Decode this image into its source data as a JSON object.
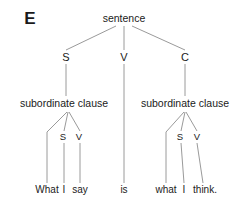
{
  "figure": {
    "label": "E",
    "caption_x": 30,
    "caption_y": 18
  },
  "colors": {
    "background": "#ffffff",
    "text": "#1a1a1a",
    "edge": "#9a9a9a"
  },
  "tree": {
    "root": {
      "text": "sentence",
      "x": 124,
      "y": 18
    },
    "level_categories": [
      {
        "text": "S",
        "x": 66,
        "y": 57
      },
      {
        "text": "V",
        "x": 124,
        "y": 57
      },
      {
        "text": "C",
        "x": 185,
        "y": 57
      }
    ],
    "clauses": [
      {
        "text": "subordinate clause",
        "x": 64,
        "y": 103
      },
      {
        "text": "subordinate clause",
        "x": 185,
        "y": 103
      }
    ],
    "clause_parts": [
      {
        "text": "S",
        "x": 63,
        "y": 137
      },
      {
        "text": "V",
        "x": 79,
        "y": 137
      },
      {
        "text": "S",
        "x": 180,
        "y": 137
      },
      {
        "text": "V",
        "x": 197,
        "y": 137
      }
    ],
    "words": [
      {
        "text": "What",
        "x": 47,
        "y": 190
      },
      {
        "text": "I",
        "x": 64,
        "y": 190
      },
      {
        "text": "say",
        "x": 80,
        "y": 190
      },
      {
        "text": "is",
        "x": 124,
        "y": 190
      },
      {
        "text": "what",
        "x": 166,
        "y": 190
      },
      {
        "text": "I",
        "x": 184,
        "y": 190
      },
      {
        "text": "think.",
        "x": 205,
        "y": 190
      }
    ],
    "edges": [
      {
        "name": "sentence-to-s",
        "x1": 116,
        "y1": 26,
        "x2": 66,
        "y2": 50
      },
      {
        "name": "sentence-to-v",
        "x1": 124,
        "y1": 26,
        "x2": 124,
        "y2": 50
      },
      {
        "name": "sentence-to-c",
        "x1": 132,
        "y1": 26,
        "x2": 185,
        "y2": 50
      },
      {
        "name": "s-to-left-clause",
        "x1": 66,
        "y1": 64,
        "x2": 66,
        "y2": 96
      },
      {
        "name": "v-to-is",
        "x1": 124,
        "y1": 64,
        "x2": 124,
        "y2": 183
      },
      {
        "name": "c-to-right-clause",
        "x1": 185,
        "y1": 64,
        "x2": 185,
        "y2": 96
      },
      {
        "name": "left-clause-to-what",
        "x1": 67,
        "y1": 112,
        "x2": 47,
        "y2": 132
      },
      {
        "name": "left-clause-to-s",
        "x1": 68,
        "y1": 112,
        "x2": 64,
        "y2": 131
      },
      {
        "name": "left-clause-to-v",
        "x1": 69,
        "y1": 112,
        "x2": 80,
        "y2": 131
      },
      {
        "name": "what-stem",
        "x1": 47,
        "y1": 132,
        "x2": 47,
        "y2": 183
      },
      {
        "name": "left-s-to-i",
        "x1": 64,
        "y1": 143,
        "x2": 64,
        "y2": 183
      },
      {
        "name": "left-v-to-say",
        "x1": 80,
        "y1": 143,
        "x2": 80,
        "y2": 183
      },
      {
        "name": "right-clause-to-what",
        "x1": 184,
        "y1": 112,
        "x2": 166,
        "y2": 132
      },
      {
        "name": "right-clause-to-s",
        "x1": 185,
        "y1": 112,
        "x2": 181,
        "y2": 131
      },
      {
        "name": "right-clause-to-v",
        "x1": 186,
        "y1": 112,
        "x2": 197,
        "y2": 131
      },
      {
        "name": "right-what-stem",
        "x1": 166,
        "y1": 132,
        "x2": 166,
        "y2": 183
      },
      {
        "name": "right-s-to-i",
        "x1": 181,
        "y1": 143,
        "x2": 184,
        "y2": 183
      },
      {
        "name": "right-v-to-think",
        "x1": 197,
        "y1": 143,
        "x2": 203,
        "y2": 183
      }
    ]
  }
}
